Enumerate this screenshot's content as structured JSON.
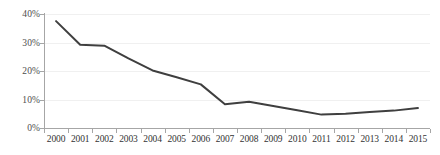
{
  "chart_data": {
    "type": "line",
    "title": "",
    "subtitle": "",
    "xlabel": "",
    "ylabel": "",
    "categories": [
      "2000",
      "2001",
      "2002",
      "2003",
      "2004",
      "2005",
      "2006",
      "2007",
      "2008",
      "2009",
      "2010",
      "2011",
      "2012",
      "2013",
      "2014",
      "2015"
    ],
    "x": [
      2000,
      2001,
      2002,
      2003,
      2004,
      2005,
      2006,
      2007,
      2008,
      2009,
      2010,
      2011,
      2012,
      2013,
      2014,
      2015
    ],
    "values": [
      37.5,
      29.2,
      28.9,
      24.4,
      20.2,
      17.8,
      15.3,
      8.3,
      9.2,
      7.7,
      6.2,
      4.7,
      5.0,
      5.6,
      6.1,
      7.0
    ],
    "series": [
      {
        "name": "",
        "values": [
          37.5,
          29.2,
          28.9,
          24.4,
          20.2,
          17.8,
          15.3,
          8.3,
          9.2,
          7.7,
          6.2,
          4.7,
          5.0,
          5.6,
          6.1,
          7.0
        ]
      }
    ],
    "ylim": [
      0,
      40
    ],
    "yticks": [
      0,
      10,
      20,
      30,
      40
    ],
    "ytick_labels": [
      "0%",
      "10%",
      "20%",
      "30%",
      "40%"
    ],
    "grid": true,
    "grid_axis": "y",
    "legend": false,
    "legend_position": "none",
    "markers": false,
    "annotations": [],
    "colors": {
      "line": "#3f3f3f",
      "gridline": "#f0f0f0",
      "axis": "#a6a6a6",
      "tick_label": "#333333",
      "y_tick_label": "#4d4d4d",
      "background": "#ffffff"
    },
    "line_width_px": 2
  }
}
